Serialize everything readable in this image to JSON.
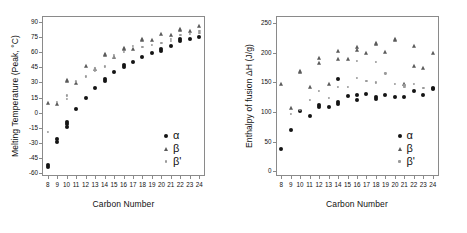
{
  "figure": {
    "panels": [
      "melting-temperature",
      "enthalpy-of-fusion"
    ],
    "marker_colors": {
      "alpha": "#141414",
      "beta": "#5a5a5a",
      "beta_prime": "#9a9a9a"
    },
    "frame_color": "#8a8a8a"
  },
  "legend": {
    "alpha_label": "α",
    "beta_label": "β",
    "beta_prime_label": "β'"
  },
  "chart_data": [
    {
      "type": "scatter",
      "id": "melting-temperature",
      "title": "",
      "xlabel": "Carbon Number",
      "ylabel": "Melting Temperature (Peak, °C)",
      "x": [
        8,
        9,
        10,
        11,
        12,
        13,
        14,
        15,
        16,
        17,
        18,
        19,
        20,
        21,
        22,
        23,
        24
      ],
      "xticklabels": [
        "8",
        "9",
        "10",
        "11",
        "12",
        "13",
        "14",
        "15",
        "16",
        "17",
        "18",
        "19",
        "20",
        "21",
        "22",
        "23",
        "24"
      ],
      "yticks": [
        -60,
        -45,
        -30,
        -15,
        0,
        15,
        30,
        45,
        60,
        75,
        90
      ],
      "xlim": [
        7.4,
        24.6
      ],
      "ylim": [
        -63,
        96
      ],
      "grid": false,
      "legend_position": "bottom-right",
      "series": [
        {
          "name": "α",
          "marker": "circle",
          "color": "#141414",
          "points": [
            {
              "x": 8,
              "y": -54
            },
            {
              "x": 8,
              "y": -52
            },
            {
              "x": 9,
              "y": -29
            },
            {
              "x": 9,
              "y": -26
            },
            {
              "x": 10,
              "y": -14
            },
            {
              "x": 10,
              "y": -11
            },
            {
              "x": 10,
              "y": -9
            },
            {
              "x": 11,
              "y": 4
            },
            {
              "x": 12,
              "y": 15
            },
            {
              "x": 13,
              "y": 24
            },
            {
              "x": 14,
              "y": 33
            },
            {
              "x": 14,
              "y": 31
            },
            {
              "x": 15,
              "y": 40
            },
            {
              "x": 16,
              "y": 45
            },
            {
              "x": 16,
              "y": 47
            },
            {
              "x": 17,
              "y": 50
            },
            {
              "x": 18,
              "y": 55
            },
            {
              "x": 19,
              "y": 59
            },
            {
              "x": 20,
              "y": 63
            },
            {
              "x": 20,
              "y": 61
            },
            {
              "x": 21,
              "y": 66
            },
            {
              "x": 22,
              "y": 71
            },
            {
              "x": 22,
              "y": 73
            },
            {
              "x": 23,
              "y": 73
            },
            {
              "x": 24,
              "y": 75
            }
          ]
        },
        {
          "name": "β",
          "marker": "triangle",
          "color": "#5a5a5a",
          "points": [
            {
              "x": 8,
              "y": 10
            },
            {
              "x": 9,
              "y": 9
            },
            {
              "x": 10,
              "y": 32
            },
            {
              "x": 10,
              "y": 31
            },
            {
              "x": 11,
              "y": 29
            },
            {
              "x": 12,
              "y": 46
            },
            {
              "x": 13,
              "y": 43
            },
            {
              "x": 14,
              "y": 58
            },
            {
              "x": 14,
              "y": 57
            },
            {
              "x": 15,
              "y": 55
            },
            {
              "x": 16,
              "y": 64
            },
            {
              "x": 16,
              "y": 63
            },
            {
              "x": 17,
              "y": 63
            },
            {
              "x": 18,
              "y": 73
            },
            {
              "x": 18,
              "y": 72
            },
            {
              "x": 19,
              "y": 72
            },
            {
              "x": 20,
              "y": 78
            },
            {
              "x": 21,
              "y": 77
            },
            {
              "x": 22,
              "y": 83
            },
            {
              "x": 22,
              "y": 82
            },
            {
              "x": 23,
              "y": 81
            },
            {
              "x": 24,
              "y": 86
            }
          ]
        },
        {
          "name": "β'",
          "marker": "dot",
          "color": "#9a9a9a",
          "points": [
            {
              "x": 8,
              "y": -19
            },
            {
              "x": 9,
              "y": 11
            },
            {
              "x": 10,
              "y": 17
            },
            {
              "x": 10,
              "y": 14
            },
            {
              "x": 11,
              "y": 31
            },
            {
              "x": 12,
              "y": 36
            },
            {
              "x": 13,
              "y": 44
            },
            {
              "x": 13,
              "y": 42
            },
            {
              "x": 14,
              "y": 46
            },
            {
              "x": 15,
              "y": 57
            },
            {
              "x": 15,
              "y": 55
            },
            {
              "x": 16,
              "y": 60
            },
            {
              "x": 17,
              "y": 66
            },
            {
              "x": 18,
              "y": 65
            },
            {
              "x": 19,
              "y": 67
            },
            {
              "x": 20,
              "y": 69
            },
            {
              "x": 21,
              "y": 73
            },
            {
              "x": 21,
              "y": 71
            },
            {
              "x": 22,
              "y": 77
            },
            {
              "x": 23,
              "y": 78
            },
            {
              "x": 24,
              "y": 81
            },
            {
              "x": 24,
              "y": 79
            }
          ]
        }
      ]
    },
    {
      "type": "scatter",
      "id": "enthalpy-of-fusion",
      "title": "",
      "xlabel": "Carbon Number",
      "ylabel": "Enthalpy of fusion ΔH (J/g)",
      "x": [
        8,
        9,
        10,
        11,
        12,
        13,
        14,
        15,
        16,
        17,
        18,
        19,
        20,
        21,
        22,
        23,
        24
      ],
      "xticklabels": [
        "8",
        "9",
        "10",
        "11",
        "12",
        "13",
        "14",
        "15",
        "16",
        "17",
        "18",
        "19",
        "20",
        "21",
        "22",
        "23",
        "24"
      ],
      "yticks": [
        0,
        50,
        100,
        150,
        200,
        250
      ],
      "xlim": [
        7.4,
        24.6
      ],
      "ylim": [
        -8,
        262
      ],
      "grid": false,
      "legend_position": "bottom-right",
      "series": [
        {
          "name": "α",
          "marker": "circle",
          "color": "#141414",
          "points": [
            {
              "x": 8,
              "y": 37
            },
            {
              "x": 9,
              "y": 70
            },
            {
              "x": 10,
              "y": 102
            },
            {
              "x": 11,
              "y": 93
            },
            {
              "x": 12,
              "y": 111
            },
            {
              "x": 12,
              "y": 109
            },
            {
              "x": 13,
              "y": 109
            },
            {
              "x": 14,
              "y": 155
            },
            {
              "x": 14,
              "y": 117
            },
            {
              "x": 14,
              "y": 114
            },
            {
              "x": 15,
              "y": 127
            },
            {
              "x": 16,
              "y": 128
            },
            {
              "x": 16,
              "y": 120
            },
            {
              "x": 17,
              "y": 130
            },
            {
              "x": 18,
              "y": 125
            },
            {
              "x": 18,
              "y": 122
            },
            {
              "x": 19,
              "y": 129
            },
            {
              "x": 20,
              "y": 126
            },
            {
              "x": 21,
              "y": 126
            },
            {
              "x": 22,
              "y": 136
            },
            {
              "x": 23,
              "y": 128
            },
            {
              "x": 24,
              "y": 141
            },
            {
              "x": 24,
              "y": 138
            }
          ]
        },
        {
          "name": "β",
          "marker": "triangle",
          "color": "#5a5a5a",
          "points": [
            {
              "x": 8,
              "y": 148
            },
            {
              "x": 9,
              "y": 107
            },
            {
              "x": 10,
              "y": 170
            },
            {
              "x": 10,
              "y": 167
            },
            {
              "x": 11,
              "y": 142
            },
            {
              "x": 12,
              "y": 191
            },
            {
              "x": 12,
              "y": 183
            },
            {
              "x": 13,
              "y": 147
            },
            {
              "x": 14,
              "y": 203
            },
            {
              "x": 14,
              "y": 190
            },
            {
              "x": 15,
              "y": 190
            },
            {
              "x": 16,
              "y": 210
            },
            {
              "x": 16,
              "y": 205
            },
            {
              "x": 17,
              "y": 199
            },
            {
              "x": 18,
              "y": 217
            },
            {
              "x": 18,
              "y": 215
            },
            {
              "x": 19,
              "y": 201
            },
            {
              "x": 20,
              "y": 224
            },
            {
              "x": 20,
              "y": 221
            },
            {
              "x": 21,
              "y": 148
            },
            {
              "x": 22,
              "y": 212
            },
            {
              "x": 22,
              "y": 178
            },
            {
              "x": 23,
              "y": 175
            },
            {
              "x": 24,
              "y": 199
            }
          ]
        },
        {
          "name": "β'",
          "marker": "dot",
          "color": "#9a9a9a",
          "points": [
            {
              "x": 9,
              "y": 97
            },
            {
              "x": 10,
              "y": 104
            },
            {
              "x": 11,
              "y": 121
            },
            {
              "x": 12,
              "y": 135
            },
            {
              "x": 13,
              "y": 124
            },
            {
              "x": 14,
              "y": 143
            },
            {
              "x": 15,
              "y": 143
            },
            {
              "x": 16,
              "y": 186
            },
            {
              "x": 16,
              "y": 157
            },
            {
              "x": 17,
              "y": 152
            },
            {
              "x": 18,
              "y": 185
            },
            {
              "x": 18,
              "y": 150
            },
            {
              "x": 19,
              "y": 165
            },
            {
              "x": 20,
              "y": 148
            },
            {
              "x": 21,
              "y": 145
            },
            {
              "x": 21,
              "y": 142
            },
            {
              "x": 22,
              "y": 147
            },
            {
              "x": 23,
              "y": 141
            }
          ]
        }
      ]
    }
  ]
}
